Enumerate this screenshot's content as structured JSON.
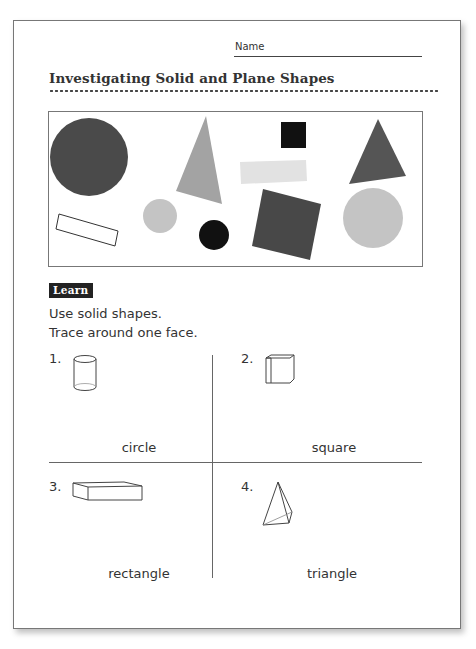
{
  "header": {
    "name_label": "Name",
    "title": "Investigating Solid and Plane Shapes"
  },
  "shapes_panel": {
    "shapes": [
      {
        "type": "circle",
        "color": "#4a4a4a",
        "size": "large"
      },
      {
        "type": "rectangle",
        "color": "none",
        "outline": true
      },
      {
        "type": "triangle",
        "color": "#a3a3a3"
      },
      {
        "type": "circle",
        "color": "#c4c4c4",
        "size": "small"
      },
      {
        "type": "circle",
        "color": "#111111",
        "size": "small"
      },
      {
        "type": "square",
        "color": "#111111",
        "size": "small"
      },
      {
        "type": "rectangle",
        "color": "#e2e2e2"
      },
      {
        "type": "square",
        "color": "#484848",
        "size": "large"
      },
      {
        "type": "triangle",
        "color": "#555555"
      },
      {
        "type": "circle",
        "color": "#c4c4c4",
        "size": "medium"
      }
    ]
  },
  "learn": {
    "badge": "Learn",
    "instruction_1": "Use solid shapes.",
    "instruction_2": "Trace around one face."
  },
  "exercises": [
    {
      "number": "1.",
      "solid": "cylinder",
      "answer": "circle"
    },
    {
      "number": "2.",
      "solid": "cube",
      "answer": "square"
    },
    {
      "number": "3.",
      "solid": "rectangular prism",
      "answer": "rectangle"
    },
    {
      "number": "4.",
      "solid": "pyramid",
      "answer": "triangle"
    }
  ]
}
